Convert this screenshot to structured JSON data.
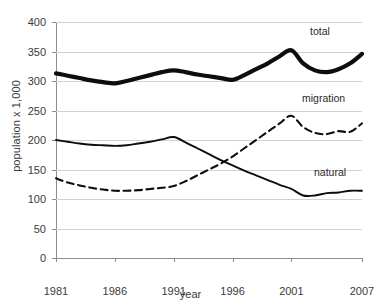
{
  "chart_data": {
    "type": "line",
    "title": "",
    "xlabel": "year",
    "ylabel": "population x 1,000",
    "xlim": [
      1981,
      2007
    ],
    "ylim": [
      0,
      400
    ],
    "grid": true,
    "legend_position": "inline-right-of-line-ends",
    "y_ticks": [
      0,
      50,
      100,
      150,
      200,
      250,
      300,
      350,
      400
    ],
    "x_ticks": [
      1981,
      1986,
      1991,
      1996,
      2001,
      2007
    ],
    "x": [
      1981,
      1982,
      1983,
      1984,
      1985,
      1986,
      1987,
      1988,
      1989,
      1990,
      1991,
      1992,
      1993,
      1994,
      1995,
      1996,
      1997,
      1998,
      1999,
      2000,
      2001,
      2002,
      2003,
      2004,
      2005,
      2006,
      2007
    ],
    "series": [
      {
        "name": "total",
        "style": "thick-solid",
        "values": [
          313,
          309,
          305,
          301,
          298,
          296,
          300,
          305,
          310,
          315,
          318,
          315,
          311,
          308,
          305,
          302,
          310,
          320,
          330,
          342,
          352,
          330,
          318,
          315,
          320,
          330,
          346
        ]
      },
      {
        "name": "migration",
        "style": "dashed",
        "values": [
          135,
          128,
          123,
          119,
          116,
          114,
          114,
          115,
          117,
          119,
          122,
          130,
          140,
          150,
          160,
          172,
          186,
          200,
          214,
          228,
          241,
          222,
          212,
          210,
          215,
          214,
          228
        ]
      },
      {
        "name": "natural",
        "style": "thin-solid",
        "values": [
          200,
          197,
          194,
          192,
          191,
          190,
          191,
          194,
          197,
          201,
          205,
          196,
          186,
          176,
          166,
          157,
          148,
          140,
          132,
          124,
          117,
          106,
          106,
          110,
          111,
          114,
          114
        ]
      }
    ]
  },
  "axes": {
    "y_title": "population x 1,000",
    "x_title": "year",
    "y_tick_labels": [
      "400",
      "350",
      "300",
      "250",
      "200",
      "150",
      "100",
      "50",
      "0"
    ],
    "x_tick_labels": [
      "1981",
      "1986",
      "1991",
      "1996",
      "2001",
      "2007"
    ]
  },
  "series_labels": [
    {
      "name": "total",
      "text": "total"
    },
    {
      "name": "migration",
      "text": "migration"
    },
    {
      "name": "natural",
      "text": "natural"
    }
  ]
}
